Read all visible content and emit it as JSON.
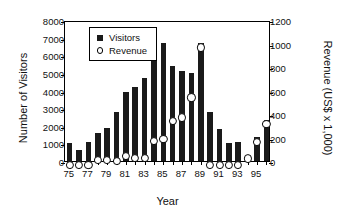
{
  "chart_data": {
    "type": "bar",
    "title": "",
    "xlabel": "Year",
    "ylabel": "Number of Visitors",
    "y2label": "Revenue (US$ x 1,000)",
    "grid": false,
    "legend_position": "top-left-inside",
    "ylim": [
      0,
      8000
    ],
    "y2lim": [
      0,
      1200
    ],
    "yticks": [
      0,
      1000,
      2000,
      3000,
      4000,
      5000,
      6000,
      7000,
      8000
    ],
    "ytick_labels": [
      "0",
      "1000",
      "2000",
      "3000",
      "4000",
      "5000",
      "6000",
      "7000",
      "8000"
    ],
    "y2ticks": [
      0,
      200,
      400,
      600,
      800,
      1000,
      1200
    ],
    "y2tick_labels": [
      "0",
      "200",
      "400",
      "600",
      "800",
      "1000",
      "1200"
    ],
    "categories": [
      "75",
      "76",
      "77",
      "78",
      "79",
      "80",
      "81",
      "82",
      "83",
      "84",
      "85",
      "86",
      "87",
      "88",
      "89",
      "90",
      "91",
      "92",
      "93",
      "94",
      "95",
      "96"
    ],
    "xtick_labels": [
      "75",
      "77",
      "79",
      "81",
      "83",
      "85",
      "87",
      "89",
      "91",
      "93",
      "95"
    ],
    "series": [
      {
        "name": "Visitors",
        "axis": "left",
        "marker": "filled-square",
        "color": "#1a1a1a",
        "values": [
          1000,
          600,
          1100,
          1600,
          1900,
          2800,
          3900,
          4200,
          4700,
          5700,
          6700,
          5400,
          5100,
          5000,
          6700,
          2800,
          1800,
          1000,
          1100,
          250,
          1350,
          2300
        ]
      },
      {
        "name": "Revenue",
        "axis": "right",
        "marker": "open-circle",
        "color": "#000000",
        "values": [
          0,
          0,
          0,
          45,
          45,
          35,
          75,
          60,
          60,
          205,
          220,
          375,
          405,
          575,
          1000,
          0,
          0,
          0,
          0,
          55,
          195,
          350
        ]
      }
    ]
  },
  "legend": {
    "items": [
      {
        "label": "Visitors",
        "swatch": "filled-square-icon"
      },
      {
        "label": "Revenue",
        "swatch": "open-circle-icon"
      }
    ]
  }
}
